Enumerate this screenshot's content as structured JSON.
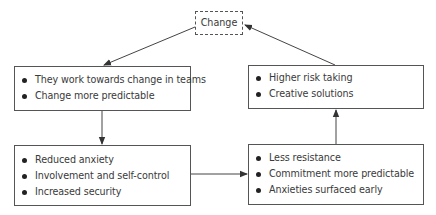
{
  "diagram": {
    "center_node": {
      "label": "Change",
      "style": "dashed"
    },
    "nodes": [
      {
        "id": "top_left",
        "items": [
          "They work towards change in teams",
          "Change more predictable"
        ]
      },
      {
        "id": "bottom_left",
        "items": [
          "Reduced anxiety",
          "Involvement and self-control",
          "Increased security"
        ]
      },
      {
        "id": "bottom_right",
        "items": [
          "Less resistance",
          "Commitment more predictable",
          "Anxieties surfaced early"
        ]
      },
      {
        "id": "top_right",
        "items": [
          "Higher risk taking",
          "Creative solutions"
        ]
      }
    ],
    "edges": [
      {
        "from": "Change",
        "to": "top_left"
      },
      {
        "from": "top_left",
        "to": "bottom_left"
      },
      {
        "from": "bottom_left",
        "to": "bottom_right"
      },
      {
        "from": "bottom_right",
        "to": "top_right"
      },
      {
        "from": "top_right",
        "to": "Change"
      }
    ],
    "colors": {
      "line": "#444444",
      "text": "#3a3a3a",
      "background": "#ffffff"
    }
  }
}
